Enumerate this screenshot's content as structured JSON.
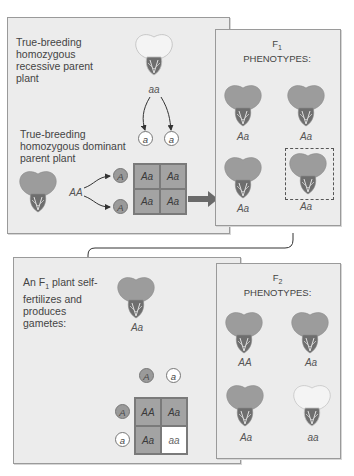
{
  "colors": {
    "panel_bg": "#ececec",
    "panel_border": "#9a9a9a",
    "dominant_cell": "#a3a3a3",
    "recessive_cell": "#ffffff",
    "dominant_flower": "#9c9c9c",
    "recessive_flower": "#f2f2f2",
    "arrow": "#6a6a6a"
  },
  "p_generation": {
    "recessive_parent_label": "True-breeding homozygous recessive parent plant",
    "recessive_parent_genotype": "aa",
    "dominant_parent_label": "True-breeding homozygous dominant parent plant",
    "dominant_parent_genotype": "AA",
    "gametes_recessive": [
      "a",
      "a"
    ],
    "gametes_dominant": [
      "A",
      "A"
    ],
    "punnett": [
      [
        "Aa",
        "Aa"
      ],
      [
        "Aa",
        "Aa"
      ]
    ]
  },
  "f1_panel": {
    "title_main": "F",
    "title_sub": "1",
    "title_line2": "PHENOTYPES:",
    "plants": [
      {
        "genotype": "Aa",
        "phenotype": "dominant"
      },
      {
        "genotype": "Aa",
        "phenotype": "dominant"
      },
      {
        "genotype": "Aa",
        "phenotype": "dominant"
      },
      {
        "genotype": "Aa",
        "phenotype": "dominant",
        "highlighted": true
      }
    ]
  },
  "f1_cross": {
    "label_prefix": "An F",
    "label_sub": "1",
    "label_rest": " plant self-fertilizes and produces gametes:",
    "plant_genotype": "Aa",
    "gametes_top": [
      "A",
      "a"
    ],
    "gametes_left": [
      "A",
      "a"
    ],
    "punnett": [
      [
        "AA",
        "Aa"
      ],
      [
        "Aa",
        "aa"
      ]
    ]
  },
  "f2_panel": {
    "title_main": "F",
    "title_sub": "2",
    "title_line2": "PHENOTYPES:",
    "plants": [
      {
        "genotype": "AA",
        "phenotype": "dominant"
      },
      {
        "genotype": "Aa",
        "phenotype": "dominant"
      },
      {
        "genotype": "Aa",
        "phenotype": "dominant"
      },
      {
        "genotype": "aa",
        "phenotype": "recessive"
      }
    ]
  }
}
